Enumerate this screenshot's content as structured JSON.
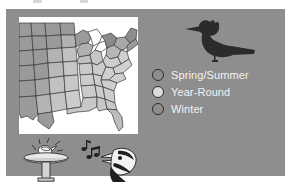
{
  "figure": {
    "name": "bird-range-map-figure",
    "panel_color": "#8e8e8e",
    "map_background_color": "#ffffff"
  },
  "map": {
    "name": "united-states-range-map",
    "region": "Eastern and Central United States",
    "state_shading": {
      "spring_summer": "#9a9a9a",
      "year_round": "#d2d2d2",
      "winter": "#787878"
    },
    "outline_color": "#3a3a3a"
  },
  "legend": {
    "items": [
      {
        "label": "Spring/Summer",
        "swatch_color": "#8e8e8e",
        "swatch_border": "#2e2e2e"
      },
      {
        "label": "Year-Round",
        "swatch_color": "#dcdcdc",
        "swatch_border": "#2e2e2e"
      },
      {
        "label": "Winter",
        "swatch_color": "#8e8e8e",
        "swatch_border": "#2e2e2e"
      }
    ],
    "text_color": "#f2f2f2"
  },
  "illustrations": {
    "perched_bird": {
      "name": "perched-bird-silhouette",
      "color": "#2b2b2b"
    },
    "birdbath": {
      "name": "birdbath-with-bird",
      "basin_color": "#e8e8e8",
      "pedestal_color": "#d0d0d0"
    },
    "singing_bird": {
      "name": "singing-bird-head",
      "head_color": "#f0f0f0",
      "accent_color": "#1f1f1f"
    },
    "music_notes": {
      "name": "music-notes",
      "color": "#1f1f1f"
    }
  }
}
